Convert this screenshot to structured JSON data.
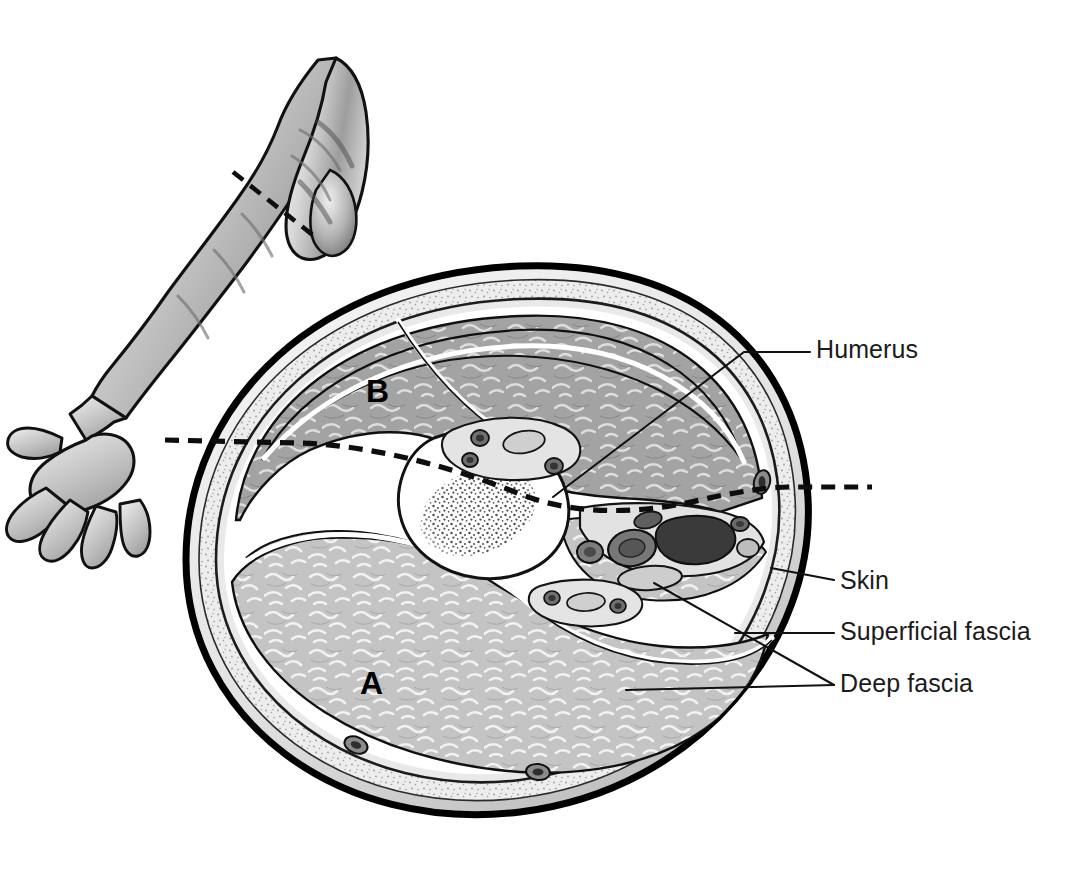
{
  "labels": [
    {
      "id": "humerus",
      "text": "Humerus",
      "x": 816,
      "y": 337
    },
    {
      "id": "skin",
      "text": "Skin",
      "x": 840,
      "y": 568
    },
    {
      "id": "superficial_fascia",
      "text": "Superficial fascia",
      "x": 840,
      "y": 619
    },
    {
      "id": "deep_fascia",
      "text": "Deep fascia",
      "x": 840,
      "y": 671
    }
  ],
  "compartments": [
    {
      "id": "a",
      "letter": "A",
      "x": 360,
      "y": 667,
      "note": "posterior compartment"
    },
    {
      "id": "b",
      "letter": "B",
      "x": 366,
      "y": 375,
      "note": "anterior compartment"
    }
  ],
  "inset": {
    "name": "upper-limb-inset",
    "section_marker": "dashed line across mid-arm"
  },
  "section_level_line": {
    "name": "section-level-dashed-line",
    "style": "dashed"
  },
  "colors": {
    "outline": "#000000",
    "skin_line": "#000000",
    "superficial_fascia": "#ebebeb",
    "deep_fascia_fill": "#d8d8d8",
    "muscle_anterior": "#a0a0a0",
    "muscle_posterior": "#c2c2c2",
    "bone_cortex": "#ffffff",
    "bone_marrow_stipple": "#4a4a4a",
    "vessel_dark": "#3b3b3b",
    "vessel_mid": "#6e6e6e",
    "vessel_light": "#bdbdbd",
    "leader_line": "#111111",
    "text": "#1b1b1b",
    "background": "#ffffff",
    "arm_skin_shade": "#9a9a9a"
  }
}
